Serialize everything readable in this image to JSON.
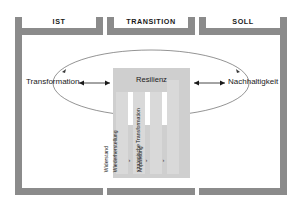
{
  "diagram": {
    "type": "conceptual-framework",
    "colors": {
      "frame": "#8b8b8b",
      "center_block": "#cfcfcf",
      "stage_bar": "#d9d9d9",
      "background": "#ffffff",
      "text": "#1a1a1a"
    }
  },
  "phases": [
    {
      "id": "ist",
      "label": "IST"
    },
    {
      "id": "transition",
      "label": "TRANSITION"
    },
    {
      "id": "soll",
      "label": "SOLL"
    }
  ],
  "poles": {
    "left": {
      "label": "Transformation",
      "arrow": "double"
    },
    "right": {
      "label": "Nachhaltigkeit",
      "arrow": "double"
    }
  },
  "center": {
    "label": "Resilienz"
  },
  "stages": [
    {
      "index": 1,
      "label": "Widerstand"
    },
    {
      "index": 2,
      "label": "Wiederherstellung"
    },
    {
      "index": 3,
      "label": "Anpassung"
    },
    {
      "index": 4,
      "label": "strategische Transformation"
    }
  ],
  "separators": {
    "glyph": "›",
    "count": 3
  },
  "cycle": {
    "shape": "ellipse",
    "direction": "bidirectional",
    "arrowheads": 2
  }
}
